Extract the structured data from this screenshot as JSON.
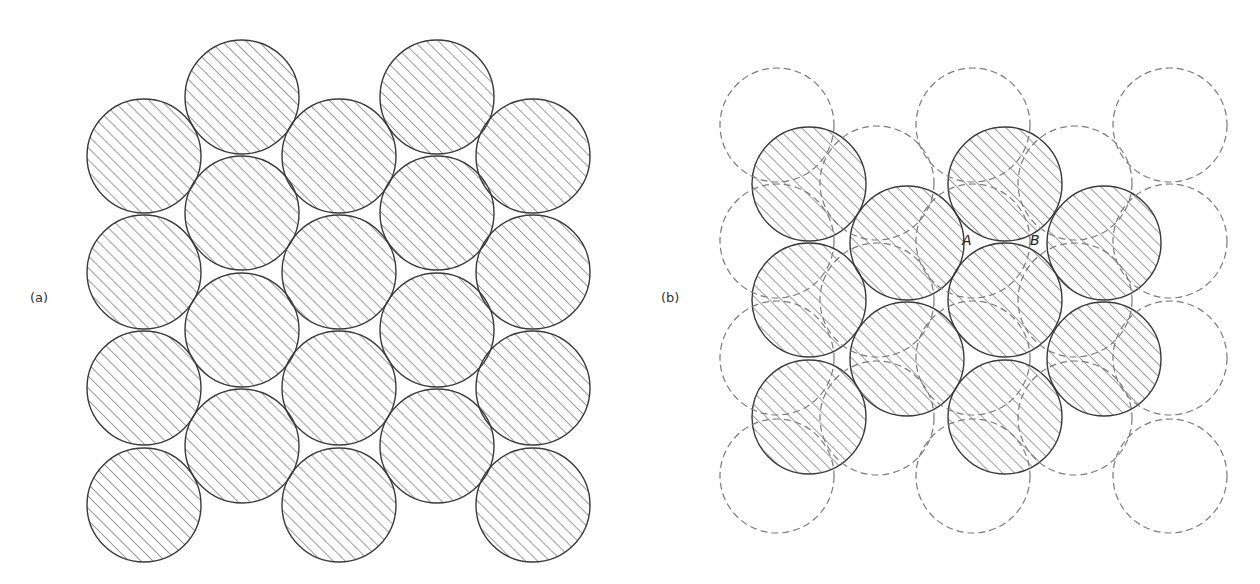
{
  "figure": {
    "circle_radius": 57,
    "colors": {
      "outline": "#3a3a3a",
      "hatch": "#6a6a6a",
      "dashed": "#7a7a7a",
      "background": "#ffffff"
    },
    "panel_a": {
      "label": "(a)",
      "label_pos": {
        "x": 30,
        "y": 290
      },
      "hatched_circles": [
        {
          "cx": 144,
          "cy": 156
        },
        {
          "cx": 144,
          "cy": 272
        },
        {
          "cx": 144,
          "cy": 388
        },
        {
          "cx": 144,
          "cy": 505
        },
        {
          "cx": 242,
          "cy": 97
        },
        {
          "cx": 242,
          "cy": 213
        },
        {
          "cx": 242,
          "cy": 330
        },
        {
          "cx": 242,
          "cy": 446
        },
        {
          "cx": 339,
          "cy": 156
        },
        {
          "cx": 339,
          "cy": 272
        },
        {
          "cx": 339,
          "cy": 388
        },
        {
          "cx": 339,
          "cy": 505
        },
        {
          "cx": 437,
          "cy": 97
        },
        {
          "cx": 437,
          "cy": 213
        },
        {
          "cx": 437,
          "cy": 330
        },
        {
          "cx": 437,
          "cy": 446
        },
        {
          "cx": 533,
          "cy": 156
        },
        {
          "cx": 533,
          "cy": 272
        },
        {
          "cx": 533,
          "cy": 388
        },
        {
          "cx": 533,
          "cy": 505
        }
      ]
    },
    "panel_b": {
      "label": "(b)",
      "label_pos": {
        "x": 661,
        "y": 290
      },
      "dashed_circles": [
        {
          "cx": 777,
          "cy": 125
        },
        {
          "cx": 777,
          "cy": 241
        },
        {
          "cx": 777,
          "cy": 358
        },
        {
          "cx": 777,
          "cy": 476
        },
        {
          "cx": 877,
          "cy": 183
        },
        {
          "cx": 877,
          "cy": 300
        },
        {
          "cx": 877,
          "cy": 418
        },
        {
          "cx": 973,
          "cy": 125
        },
        {
          "cx": 973,
          "cy": 241
        },
        {
          "cx": 973,
          "cy": 358
        },
        {
          "cx": 973,
          "cy": 476
        },
        {
          "cx": 1075,
          "cy": 183
        },
        {
          "cx": 1075,
          "cy": 300
        },
        {
          "cx": 1075,
          "cy": 418
        },
        {
          "cx": 1170,
          "cy": 125
        },
        {
          "cx": 1170,
          "cy": 241
        },
        {
          "cx": 1170,
          "cy": 358
        },
        {
          "cx": 1170,
          "cy": 476
        }
      ],
      "hatched_circles": [
        {
          "cx": 809,
          "cy": 184
        },
        {
          "cx": 809,
          "cy": 300
        },
        {
          "cx": 809,
          "cy": 417
        },
        {
          "cx": 907,
          "cy": 243
        },
        {
          "cx": 907,
          "cy": 359
        },
        {
          "cx": 1005,
          "cy": 184
        },
        {
          "cx": 1005,
          "cy": 300
        },
        {
          "cx": 1005,
          "cy": 417
        },
        {
          "cx": 1104,
          "cy": 243
        },
        {
          "cx": 1104,
          "cy": 359
        }
      ],
      "points": [
        {
          "label": "A",
          "x": 962,
          "y": 232
        },
        {
          "label": "B",
          "x": 1030,
          "y": 232
        }
      ]
    }
  }
}
